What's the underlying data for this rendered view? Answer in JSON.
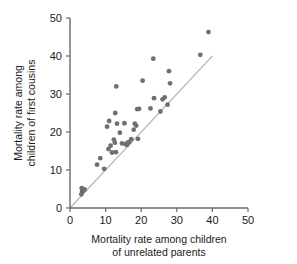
{
  "chart_data": {
    "type": "scatter",
    "title": "",
    "xlabel": "Mortality rate among children of unrelated parents",
    "xlabel_line1": "Mortality rate among children",
    "xlabel_line2": "of unrelated parents",
    "ylabel": "Mortality rate among children of first cousins",
    "ylabel_line1": "Mortality rate among",
    "ylabel_line2": "children of first cousins",
    "xlim": [
      0,
      50
    ],
    "ylim": [
      0,
      50
    ],
    "xticks": [
      0,
      10,
      20,
      30,
      40,
      50
    ],
    "yticks": [
      0,
      10,
      20,
      30,
      40,
      50
    ],
    "xtick_labels": [
      "0",
      "10",
      "20",
      "30",
      "40",
      "50"
    ],
    "ytick_labels": [
      "0",
      "10",
      "20",
      "30",
      "40",
      "50"
    ],
    "grid": false,
    "legend": null,
    "point_color": "#6f6f6f",
    "reference_line": {
      "label": "identity line (y = x)",
      "color": "#b9b9b9",
      "x": [
        0,
        40
      ],
      "y": [
        0,
        40
      ]
    },
    "points": [
      {
        "x": 3.2,
        "y": 3.6
      },
      {
        "x": 3.4,
        "y": 4.3
      },
      {
        "x": 3.5,
        "y": 5.0
      },
      {
        "x": 3.8,
        "y": 4.6
      },
      {
        "x": 4.1,
        "y": 4.9
      },
      {
        "x": 3.3,
        "y": 5.2
      },
      {
        "x": 7.6,
        "y": 11.4
      },
      {
        "x": 8.5,
        "y": 13.1
      },
      {
        "x": 9.6,
        "y": 10.3
      },
      {
        "x": 10.4,
        "y": 21.4
      },
      {
        "x": 11.0,
        "y": 22.9
      },
      {
        "x": 10.8,
        "y": 15.5
      },
      {
        "x": 11.4,
        "y": 16.4
      },
      {
        "x": 11.8,
        "y": 14.6
      },
      {
        "x": 12.3,
        "y": 18.0
      },
      {
        "x": 12.6,
        "y": 17.2
      },
      {
        "x": 12.9,
        "y": 14.7
      },
      {
        "x": 12.7,
        "y": 25.0
      },
      {
        "x": 13.0,
        "y": 32.0
      },
      {
        "x": 13.2,
        "y": 22.2
      },
      {
        "x": 14.0,
        "y": 19.8
      },
      {
        "x": 14.6,
        "y": 17.0
      },
      {
        "x": 15.3,
        "y": 22.3
      },
      {
        "x": 15.6,
        "y": 16.8
      },
      {
        "x": 16.0,
        "y": 16.6
      },
      {
        "x": 16.2,
        "y": 17.2
      },
      {
        "x": 16.6,
        "y": 17.3
      },
      {
        "x": 17.2,
        "y": 18.1
      },
      {
        "x": 17.9,
        "y": 20.6
      },
      {
        "x": 18.2,
        "y": 22.2
      },
      {
        "x": 18.6,
        "y": 21.7
      },
      {
        "x": 18.9,
        "y": 26.0
      },
      {
        "x": 19.4,
        "y": 26.1
      },
      {
        "x": 19.1,
        "y": 18.2
      },
      {
        "x": 20.4,
        "y": 33.5
      },
      {
        "x": 22.6,
        "y": 26.2
      },
      {
        "x": 23.4,
        "y": 39.3
      },
      {
        "x": 23.6,
        "y": 28.9
      },
      {
        "x": 25.4,
        "y": 25.4
      },
      {
        "x": 26.0,
        "y": 28.6
      },
      {
        "x": 26.6,
        "y": 29.1
      },
      {
        "x": 27.4,
        "y": 27.2
      },
      {
        "x": 27.8,
        "y": 36.0
      },
      {
        "x": 28.1,
        "y": 32.8
      },
      {
        "x": 36.6,
        "y": 40.3
      },
      {
        "x": 38.9,
        "y": 46.3
      }
    ]
  }
}
